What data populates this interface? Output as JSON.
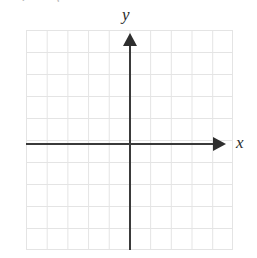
{
  "figure": {
    "kind": "blank-cartesian-coordinate-grid",
    "clipped_text_above": ". ,",
    "labels": {
      "y_axis": "y",
      "x_axis": "x"
    },
    "icons": {
      "y_arrow": "arrow-up-icon",
      "x_arrow": "arrow-right-icon"
    },
    "colors": {
      "background": "#ffffff",
      "grid_line": "#e4e4e4",
      "axis_line": "#3a3a3a",
      "arrow_fill": "#2e2e2e",
      "label_text": "#2b2b2b"
    }
  },
  "chart_data": {
    "type": "scatter",
    "title": "",
    "subtitle": "",
    "xlabel": "x",
    "ylabel": "y",
    "series": [
      {
        "name": "",
        "x": [],
        "y": []
      }
    ],
    "annotations": [],
    "legend": [],
    "legend_position": "none",
    "grid": true,
    "grid_columns": 10,
    "grid_rows": 10,
    "xlim": [
      -5,
      5
    ],
    "ylim": [
      -5,
      5
    ],
    "xticks": [
      -5,
      -4,
      -3,
      -2,
      -1,
      0,
      1,
      2,
      3,
      4,
      5
    ],
    "yticks": [
      -5,
      -4,
      -3,
      -2,
      -1,
      0,
      1,
      2,
      3,
      4,
      5
    ],
    "xtick_labels": [
      "",
      "",
      "",
      "",
      "",
      "",
      "",
      "",
      "",
      "",
      ""
    ],
    "ytick_labels": [
      "",
      "",
      "",
      "",
      "",
      "",
      "",
      "",
      "",
      "",
      ""
    ],
    "origin_grid_cell": [
      5,
      5
    ],
    "axis_arrows": [
      "x-positive",
      "y-positive"
    ]
  }
}
